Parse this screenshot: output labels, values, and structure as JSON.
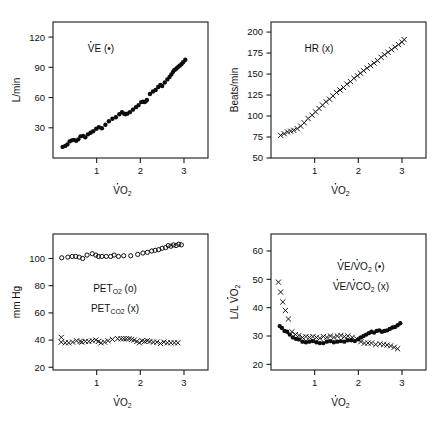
{
  "figure": {
    "kind": "multi-panel-scatter-figure",
    "panel_count": 4,
    "background_color": "#ffffff",
    "ink_color": "#0d0d0d"
  },
  "chart_data": [
    {
      "id": "panel-ve",
      "position": "top-left",
      "type": "scatter",
      "title": "",
      "legend": [
        {
          "label": "V̇E (•)",
          "marker": "filled-circle"
        }
      ],
      "legend_position": "upper-left-inside",
      "xlabel": "V̇O₂",
      "ylabel": "L/min",
      "xlim": [
        0,
        3.55
      ],
      "ylim": [
        0,
        135
      ],
      "xticks": [
        1,
        2,
        3
      ],
      "xtick_labels": [
        "1",
        "2",
        "3"
      ],
      "yticks": [
        30,
        60,
        90,
        120
      ],
      "ytick_labels": [
        "30",
        "60",
        "90",
        "120"
      ],
      "grid": false,
      "series": [
        {
          "name": "VE",
          "marker": "filled-circle",
          "x": [
            0.22,
            0.28,
            0.33,
            0.38,
            0.43,
            0.48,
            0.53,
            0.58,
            0.63,
            0.69,
            0.74,
            0.8,
            0.86,
            0.92,
            0.99,
            1.05,
            1.12,
            1.2,
            1.28,
            1.36,
            1.44,
            1.52,
            1.58,
            1.63,
            1.66,
            1.7,
            1.76,
            1.83,
            1.9,
            1.96,
            2.02,
            2.06,
            2.09,
            2.12,
            2.15,
            2.22,
            2.29,
            2.35,
            2.41,
            2.46,
            2.5,
            2.56,
            2.62,
            2.67,
            2.71,
            2.75,
            2.78,
            2.81,
            2.84,
            2.87,
            2.9,
            2.94,
            2.98,
            3.03
          ],
          "y": [
            11.0,
            12.0,
            13.5,
            16.5,
            17.5,
            18.0,
            17.0,
            18.5,
            21.5,
            22.0,
            20.5,
            23.5,
            25.0,
            26.5,
            29.0,
            30.5,
            29.5,
            33.0,
            36.5,
            39.0,
            40.5,
            43.5,
            45.5,
            44.0,
            43.5,
            44.0,
            45.5,
            48.0,
            50.5,
            52.5,
            55.5,
            56.0,
            55.5,
            56.0,
            57.5,
            63.5,
            66.0,
            67.5,
            70.5,
            72.5,
            71.5,
            75.0,
            78.0,
            80.5,
            83.0,
            85.5,
            87.5,
            88.0,
            89.5,
            90.5,
            91.5,
            93.0,
            95.0,
            97.5
          ]
        }
      ]
    },
    {
      "id": "panel-hr",
      "position": "top-right",
      "type": "scatter",
      "title": "",
      "legend": [
        {
          "label": "HR (x)",
          "marker": "cross"
        }
      ],
      "legend_position": "upper-left-inside",
      "xlabel": "V̇O₂",
      "ylabel": "Beats/min",
      "xlim": [
        0,
        3.55
      ],
      "ylim": [
        50,
        212
      ],
      "xticks": [
        1,
        2,
        3
      ],
      "xtick_labels": [
        "1",
        "2",
        "3"
      ],
      "yticks": [
        50,
        75,
        100,
        125,
        150,
        175,
        200
      ],
      "ytick_labels": [
        "50",
        "75",
        "100",
        "125",
        "150",
        "175",
        "200"
      ],
      "grid": false,
      "series": [
        {
          "name": "HR",
          "marker": "cross",
          "x": [
            0.22,
            0.3,
            0.38,
            0.45,
            0.52,
            0.6,
            0.68,
            0.76,
            0.85,
            0.94,
            1.02,
            1.1,
            1.18,
            1.26,
            1.34,
            1.42,
            1.5,
            1.58,
            1.66,
            1.74,
            1.82,
            1.9,
            1.98,
            2.05,
            2.12,
            2.2,
            2.28,
            2.36,
            2.44,
            2.52,
            2.6,
            2.68,
            2.76,
            2.84,
            2.92,
            3.0,
            3.05
          ],
          "y": [
            77,
            79,
            81,
            82,
            83,
            85,
            88,
            92,
            97,
            101,
            105,
            109,
            113,
            117,
            120,
            124,
            128,
            131,
            134,
            138,
            141,
            145,
            148,
            151,
            154,
            157,
            160,
            163,
            166,
            170,
            173,
            176,
            179,
            182,
            185,
            188,
            191
          ]
        }
      ]
    },
    {
      "id": "panel-pet",
      "position": "bottom-left",
      "type": "scatter",
      "title": "",
      "legend": [
        {
          "label": "PETₒ₂ (o)",
          "marker": "open-circle"
        },
        {
          "label": "PETᴄₒ₂ (x)",
          "marker": "cross"
        }
      ],
      "legend_position": "center-inside",
      "xlabel": "V̇O₂",
      "ylabel": "mm Hg",
      "xlim": [
        0,
        3.55
      ],
      "ylim": [
        18,
        118
      ],
      "xticks": [
        1,
        2,
        3
      ],
      "xtick_labels": [
        "1",
        "2",
        "3"
      ],
      "yticks": [
        20,
        40,
        60,
        80,
        100
      ],
      "ytick_labels": [
        "20",
        "40",
        "60",
        "80",
        "100"
      ],
      "grid": false,
      "series": [
        {
          "name": "PETO2",
          "marker": "open-circle",
          "x": [
            0.2,
            0.34,
            0.44,
            0.52,
            0.6,
            0.68,
            0.78,
            0.9,
            0.98,
            1.04,
            1.12,
            1.22,
            1.32,
            1.4,
            1.5,
            1.62,
            1.78,
            1.94,
            2.06,
            2.16,
            2.26,
            2.34,
            2.42,
            2.5,
            2.58,
            2.64,
            2.7,
            2.76,
            2.82,
            2.88,
            2.94
          ],
          "y": [
            100.5,
            101.0,
            101.5,
            101.5,
            101.0,
            100.0,
            102.5,
            103.5,
            102.5,
            101.5,
            101.5,
            101.5,
            101.5,
            102.5,
            101.5,
            102.0,
            102.0,
            103.0,
            104.0,
            104.5,
            105.5,
            106.0,
            106.5,
            107.5,
            108.0,
            109.5,
            109.0,
            110.0,
            109.5,
            110.5,
            110.0
          ]
        },
        {
          "name": "PETCO2",
          "marker": "cross",
          "x": [
            0.19,
            0.19,
            0.28,
            0.36,
            0.45,
            0.54,
            0.62,
            0.66,
            0.74,
            0.82,
            0.9,
            0.98,
            1.04,
            1.1,
            1.18,
            1.26,
            1.36,
            1.48,
            1.56,
            1.62,
            1.68,
            1.74,
            1.8,
            1.86,
            1.92,
            1.98,
            2.04,
            2.1,
            2.16,
            2.22,
            2.3,
            2.38,
            2.46,
            2.54,
            2.62,
            2.7,
            2.78,
            2.86
          ],
          "y": [
            42.0,
            38.5,
            38.0,
            38.0,
            38.5,
            39.5,
            39.0,
            38.5,
            39.0,
            39.0,
            39.5,
            40.0,
            39.0,
            38.0,
            38.5,
            39.5,
            40.5,
            41.0,
            41.0,
            41.0,
            41.0,
            41.0,
            40.5,
            40.0,
            39.0,
            38.0,
            39.5,
            39.0,
            39.5,
            39.0,
            38.5,
            38.5,
            37.5,
            38.5,
            38.0,
            38.0,
            38.0,
            38.0
          ]
        }
      ]
    },
    {
      "id": "panel-equiv",
      "position": "bottom-right",
      "type": "scatter",
      "title": "",
      "legend": [
        {
          "label": "V̇E/V̇O₂ (•)",
          "marker": "filled-circle"
        },
        {
          "label": "V̇E/V̇CO₂ (x)",
          "marker": "cross"
        }
      ],
      "legend_position": "upper-right-inside",
      "xlabel": "V̇O₂",
      "ylabel": "L/L V̇O₂",
      "xlim": [
        0,
        3.55
      ],
      "ylim": [
        18,
        66
      ],
      "xticks": [
        1,
        2,
        3
      ],
      "xtick_labels": [
        "1",
        "2",
        "3"
      ],
      "yticks": [
        20,
        30,
        40,
        50,
        60
      ],
      "ytick_labels": [
        "20",
        "30",
        "40",
        "50",
        "60"
      ],
      "grid": false,
      "series": [
        {
          "name": "VE/VO2",
          "marker": "filled-circle",
          "x": [
            0.2,
            0.25,
            0.31,
            0.37,
            0.43,
            0.5,
            0.57,
            0.64,
            0.72,
            0.8,
            0.88,
            0.96,
            1.04,
            1.12,
            1.2,
            1.28,
            1.36,
            1.44,
            1.52,
            1.6,
            1.68,
            1.76,
            1.84,
            1.92,
            2.0,
            2.06,
            2.12,
            2.18,
            2.24,
            2.3,
            2.36,
            2.42,
            2.48,
            2.54,
            2.6,
            2.66,
            2.72,
            2.78,
            2.84,
            2.9,
            2.96
          ],
          "y": [
            33.5,
            32.8,
            31.8,
            31.5,
            30.5,
            29.5,
            29.0,
            28.8,
            28.0,
            27.8,
            28.0,
            28.2,
            27.8,
            27.5,
            27.5,
            28.0,
            28.2,
            27.8,
            28.0,
            28.2,
            28.0,
            28.5,
            28.5,
            28.2,
            28.8,
            29.5,
            30.0,
            30.5,
            31.0,
            31.5,
            31.2,
            31.8,
            32.0,
            31.5,
            31.8,
            32.0,
            32.5,
            33.0,
            33.2,
            33.8,
            34.5
          ]
        },
        {
          "name": "VE/VCO2",
          "marker": "cross",
          "x": [
            0.17,
            0.22,
            0.27,
            0.33,
            0.4,
            0.48,
            0.56,
            0.64,
            0.72,
            0.8,
            0.88,
            0.96,
            1.04,
            1.12,
            1.2,
            1.28,
            1.36,
            1.44,
            1.52,
            1.6,
            1.68,
            1.76,
            1.86,
            1.96,
            2.06,
            2.14,
            2.22,
            2.3,
            2.4,
            2.5,
            2.58,
            2.66,
            2.74,
            2.82,
            2.9
          ],
          "y": [
            49.0,
            45.5,
            42.0,
            39.0,
            36.0,
            31.5,
            30.5,
            30.2,
            29.5,
            29.8,
            29.5,
            29.8,
            29.5,
            29.2,
            29.8,
            29.5,
            30.0,
            29.5,
            30.0,
            30.2,
            29.8,
            30.0,
            29.5,
            29.0,
            28.0,
            27.5,
            27.5,
            27.5,
            27.0,
            27.2,
            27.0,
            26.8,
            26.5,
            26.0,
            25.5
          ]
        }
      ]
    }
  ]
}
